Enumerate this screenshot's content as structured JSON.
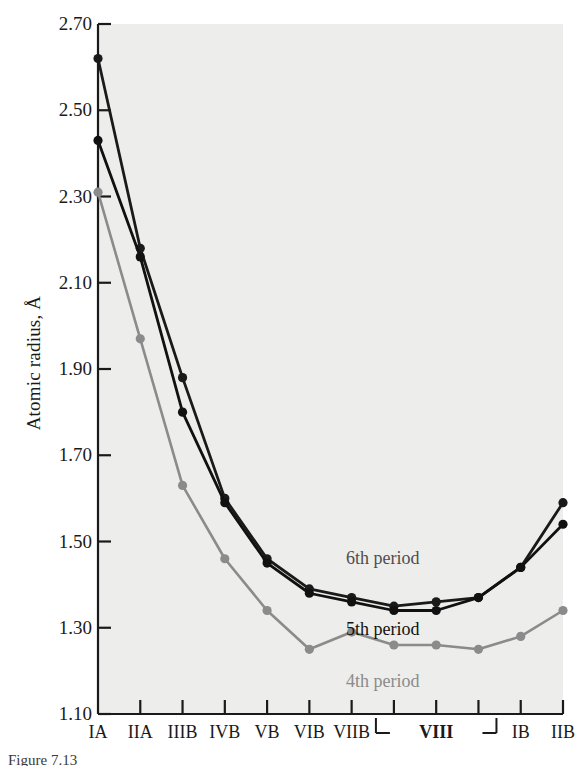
{
  "figure": {
    "background_color": "#ffffff",
    "plot_background_color": "#ededec",
    "caption": "Figure 7.13"
  },
  "chart_data": {
    "type": "line",
    "title": "",
    "xlabel": "",
    "ylabel": "Atomic radius, Å",
    "categories": [
      "IA",
      "IIA",
      "IIIB",
      "IVB",
      "VB",
      "VIB",
      "VIIB",
      "VIII",
      "VIII",
      "VIII",
      "IB",
      "IIB"
    ],
    "tick_labels": [
      "IA",
      "IIA",
      "IIIB",
      "IVB",
      "VB",
      "VIB",
      "VIIB",
      "",
      "VIII",
      "",
      "IB",
      "IIB"
    ],
    "group_bracket": {
      "label": "VIII",
      "start_index": 7,
      "end_index": 9,
      "bold": true
    },
    "ylim": [
      1.1,
      2.7
    ],
    "yticks": [
      "2.70",
      "2.50",
      "2.30",
      "2.10",
      "1.90",
      "1.70",
      "1.50",
      "1.30",
      "1.10"
    ],
    "ytick_values": [
      2.7,
      2.5,
      2.3,
      2.1,
      1.9,
      1.7,
      1.5,
      1.3,
      1.1
    ],
    "grid": false,
    "legend_position": "inline-annotations",
    "series": [
      {
        "name": "6th period",
        "color": "#1a1a1a",
        "label_color": "#4d4d4d",
        "marker": "circle",
        "values": [
          2.62,
          2.18,
          1.88,
          1.6,
          1.46,
          1.39,
          1.37,
          1.35,
          1.36,
          1.37,
          1.44,
          1.59
        ]
      },
      {
        "name": "5th period",
        "color": "#111111",
        "label_color": "#111111",
        "marker": "circle",
        "values": [
          2.43,
          2.16,
          1.8,
          1.59,
          1.45,
          1.38,
          1.36,
          1.34,
          1.34,
          1.37,
          1.44,
          1.54
        ]
      },
      {
        "name": "4th period",
        "color": "#8b8b8b",
        "label_color": "#8b8b8b",
        "marker": "circle",
        "values": [
          2.31,
          1.97,
          1.63,
          1.46,
          1.34,
          1.25,
          1.29,
          1.26,
          1.26,
          1.25,
          1.28,
          1.34
        ]
      }
    ],
    "annotations": [
      {
        "text": "6th period",
        "x_index": 7.0,
        "y_value": 1.46,
        "color": "#4d4d4d"
      },
      {
        "text": "5th period",
        "x_index": 7.0,
        "y_value": 1.295,
        "color": "#111111"
      },
      {
        "text": "4th period",
        "x_index": 7.0,
        "y_value": 1.175,
        "color": "#8b8b8b"
      }
    ]
  }
}
